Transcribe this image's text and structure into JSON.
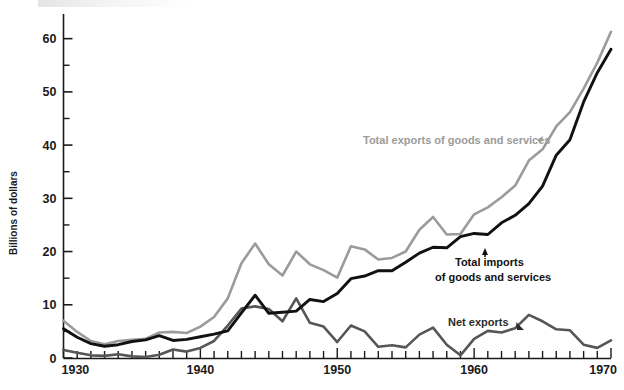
{
  "chart_data": {
    "type": "line",
    "title": "",
    "subtitle": "",
    "xlabel": "",
    "ylabel": "Billions of dollars",
    "xlim": [
      1930,
      1970
    ],
    "ylim": [
      0,
      62
    ],
    "grid": false,
    "legend_position": "inline-annotations",
    "x_tick_labels": [
      "1930",
      "1940",
      "1950",
      "1960",
      "1970"
    ],
    "x_major_ticks": [
      1930,
      1940,
      1950,
      1960,
      1970
    ],
    "x_minor_tick_interval": 1,
    "y_tick_labels": [
      "0",
      "10",
      "20",
      "30",
      "40",
      "50",
      "60"
    ],
    "y_major_ticks": [
      0,
      10,
      20,
      30,
      40,
      50,
      60
    ],
    "y_minor_ticks": [
      5,
      15,
      25,
      35,
      45,
      55
    ],
    "x": [
      1930,
      1931,
      1932,
      1933,
      1934,
      1935,
      1936,
      1937,
      1938,
      1939,
      1940,
      1941,
      1942,
      1943,
      1944,
      1945,
      1946,
      1947,
      1948,
      1949,
      1950,
      1951,
      1952,
      1953,
      1954,
      1955,
      1956,
      1957,
      1958,
      1959,
      1960,
      1961,
      1962,
      1963,
      1964,
      1965,
      1966,
      1967,
      1968,
      1969,
      1970
    ],
    "series": [
      {
        "name": "Total exports of goods and services",
        "color": "#9b9b9b",
        "values": [
          7.0,
          4.9,
          3.2,
          2.6,
          3.2,
          3.4,
          3.6,
          4.8,
          4.9,
          4.7,
          5.9,
          7.7,
          11.2,
          17.8,
          21.5,
          17.6,
          15.5,
          20.0,
          17.6,
          16.5,
          15.1,
          21.0,
          20.4,
          18.5,
          18.8,
          20.0,
          24.1,
          26.5,
          23.2,
          23.3,
          27.0,
          28.3,
          30.2,
          32.4,
          37.1,
          39.2,
          43.5,
          46.2,
          50.6,
          55.5,
          61.3
        ]
      },
      {
        "name": "Total imports of goods and services",
        "color": "#111111",
        "values": [
          5.5,
          3.9,
          2.7,
          2.2,
          2.5,
          3.1,
          3.4,
          4.2,
          3.3,
          3.5,
          4.0,
          4.5,
          5.1,
          8.5,
          11.8,
          8.4,
          8.6,
          8.8,
          11.0,
          10.6,
          12.1,
          14.9,
          15.4,
          16.4,
          16.4,
          18.0,
          19.7,
          20.8,
          20.7,
          22.8,
          23.4,
          23.2,
          25.4,
          26.8,
          29.0,
          32.3,
          38.1,
          41.0,
          48.1,
          53.6,
          58.0
        ]
      },
      {
        "name": "Net exports",
        "color": "#565656",
        "values": [
          1.5,
          1.0,
          0.5,
          0.4,
          0.7,
          0.3,
          0.2,
          0.6,
          1.6,
          1.2,
          1.9,
          3.2,
          6.1,
          9.3,
          9.7,
          9.2,
          6.9,
          11.2,
          6.6,
          5.9,
          3.0,
          6.1,
          5.0,
          2.1,
          2.4,
          2.0,
          4.4,
          5.7,
          2.5,
          0.5,
          3.6,
          5.1,
          4.8,
          5.6,
          8.1,
          6.9,
          5.4,
          5.2,
          2.5,
          1.9,
          3.3
        ]
      }
    ],
    "annotations": [
      {
        "text": "Total exports of goods and services",
        "series": "Total exports of goods and services"
      },
      {
        "text": "Total imports",
        "series": "Total imports of goods and services"
      },
      {
        "text": "of goods and services",
        "series": "Total imports of goods and services"
      },
      {
        "text": "Net exports",
        "series": "Net exports"
      }
    ]
  },
  "axes": {
    "y_title": "Billions of dollars",
    "y_labels": {
      "t0": "0",
      "t10": "10",
      "t20": "20",
      "t30": "30",
      "t40": "40",
      "t50": "50",
      "t60": "60"
    },
    "x_labels": {
      "x1930": "1930",
      "x1940": "1940",
      "x1950": "1950",
      "x1960": "1960",
      "x1970": "1970"
    }
  },
  "annotations": {
    "exports": "Total exports of goods and services",
    "imports_line1": "Total imports",
    "imports_line2": "of goods and services",
    "net": "Net exports"
  },
  "colors": {
    "exports": "#9b9b9b",
    "imports": "#111111",
    "net": "#565656",
    "axis": "#1a1a1a",
    "background": "#ffffff"
  }
}
